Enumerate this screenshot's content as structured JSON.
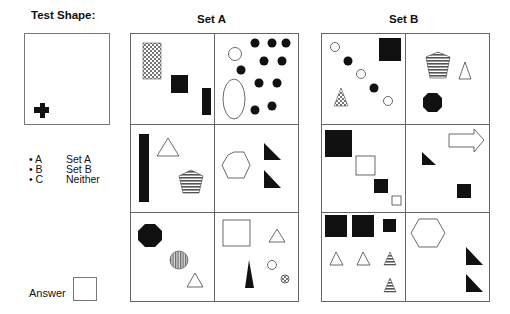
{
  "test_shape": {
    "label": "Test Shape:",
    "shape": "black-cross"
  },
  "set_a": {
    "label": "Set A"
  },
  "set_b": {
    "label": "Set B"
  },
  "options": [
    {
      "bullet": "•",
      "key": "A",
      "text": "Set A"
    },
    {
      "bullet": "•",
      "key": "B",
      "text": "Set B"
    },
    {
      "bullet": "•",
      "key": "C",
      "text": "Neither"
    }
  ],
  "answer": {
    "label": "Answer",
    "value": ""
  },
  "colors": {
    "border": "#777777",
    "fill": "#111111",
    "hatch": "#888888"
  }
}
